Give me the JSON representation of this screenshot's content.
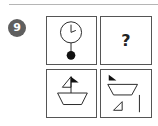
{
  "question": {
    "number": "9",
    "badge_color": "#5f5f5f"
  },
  "grid": {
    "cells": [
      {
        "position": "top-left",
        "figure": "pendulum-clock-icon",
        "description": "clock face with hands and pendulum weight"
      },
      {
        "position": "top-right",
        "figure": "question-mark",
        "label": "?"
      },
      {
        "position": "bottom-left",
        "figure": "sailboat-icon",
        "description": "assembled boat with sail and flag"
      },
      {
        "position": "bottom-right",
        "figure": "sailboat-parts-icon",
        "description": "disassembled boat: flag, hull, sail, mast"
      }
    ]
  }
}
